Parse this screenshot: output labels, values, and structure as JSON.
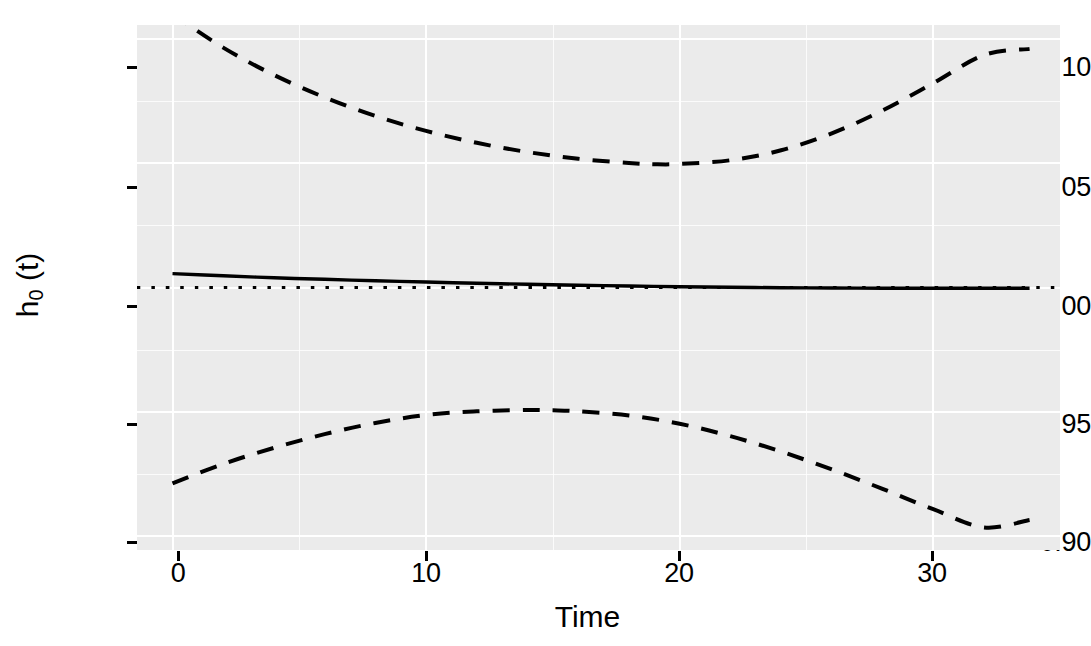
{
  "chart_data": {
    "type": "line",
    "title": "",
    "subtitle": "",
    "xlabel": "Time",
    "ylabel": "h0 (t)",
    "ylabel_base": "h",
    "ylabel_sub": "0",
    "ylabel_arg": " (t)",
    "xlim": [
      -1.4,
      35.0
    ],
    "ylim": [
      0.8944,
      1.1056
    ],
    "x_ticks": [
      0,
      10,
      20,
      30
    ],
    "x_tick_labels": [
      "0",
      "10",
      "20",
      "30"
    ],
    "y_ticks": [
      0.9,
      0.95,
      1.0,
      1.05,
      1.1
    ],
    "y_tick_labels": [
      "0.90",
      "0.95",
      "1.00",
      "1.05",
      "1.10"
    ],
    "x_minor_ticks": [
      5,
      15,
      25
    ],
    "y_minor_ticks": [
      0.925,
      0.975,
      1.025,
      1.075
    ],
    "grid": true,
    "grid_color": "#ffffff",
    "panel_color": "#ebebeb",
    "legend": false,
    "legend_position": "none",
    "x_data_range": [
      0,
      33.8
    ],
    "series": [
      {
        "name": "estimate",
        "style": "solid",
        "color": "#000000",
        "width": 3.4,
        "x": [
          0,
          2,
          4,
          6,
          8,
          10,
          12,
          14,
          16,
          18,
          20,
          22,
          24,
          26,
          28,
          30,
          32,
          33.8
        ],
        "values": [
          1.0056,
          1.0047,
          1.0039,
          1.0033,
          1.0027,
          1.0022,
          1.0017,
          1.0013,
          1.0009,
          1.0006,
          1.0003,
          1.0001,
          0.9999,
          0.9998,
          0.9997,
          0.9997,
          0.9997,
          0.9997
        ]
      },
      {
        "name": "upper-confidence-band",
        "style": "dashed",
        "color": "#000000",
        "width": 4.0,
        "x": [
          0,
          2,
          4,
          6,
          8,
          10,
          12,
          14,
          16,
          18,
          19,
          20,
          22,
          24,
          26,
          28,
          30,
          32,
          33.8
        ],
        "values": [
          1.11,
          1.0965,
          1.0855,
          1.0765,
          1.069,
          1.063,
          1.0582,
          1.0545,
          1.0518,
          1.0501,
          1.0496,
          1.0497,
          1.0512,
          1.0552,
          1.062,
          1.0712,
          1.0822,
          1.0935,
          1.096
        ]
      },
      {
        "name": "lower-confidence-band",
        "style": "dashed",
        "color": "#000000",
        "width": 4.0,
        "x": [
          0,
          2,
          4,
          6,
          8,
          10,
          12,
          14,
          15,
          16,
          18,
          20,
          22,
          24,
          26,
          28,
          30,
          32,
          33.8
        ],
        "values": [
          0.9212,
          0.929,
          0.9355,
          0.941,
          0.9455,
          0.9487,
          0.9502,
          0.9507,
          0.9506,
          0.9502,
          0.9485,
          0.9452,
          0.9402,
          0.934,
          0.9268,
          0.919,
          0.9108,
          0.9035,
          0.9065
        ]
      },
      {
        "name": "reference-line",
        "style": "dotted",
        "color": "#000000",
        "width": 3.2,
        "x": [
          -1.4,
          35.0
        ],
        "values": [
          1.0,
          1.0
        ]
      }
    ]
  }
}
